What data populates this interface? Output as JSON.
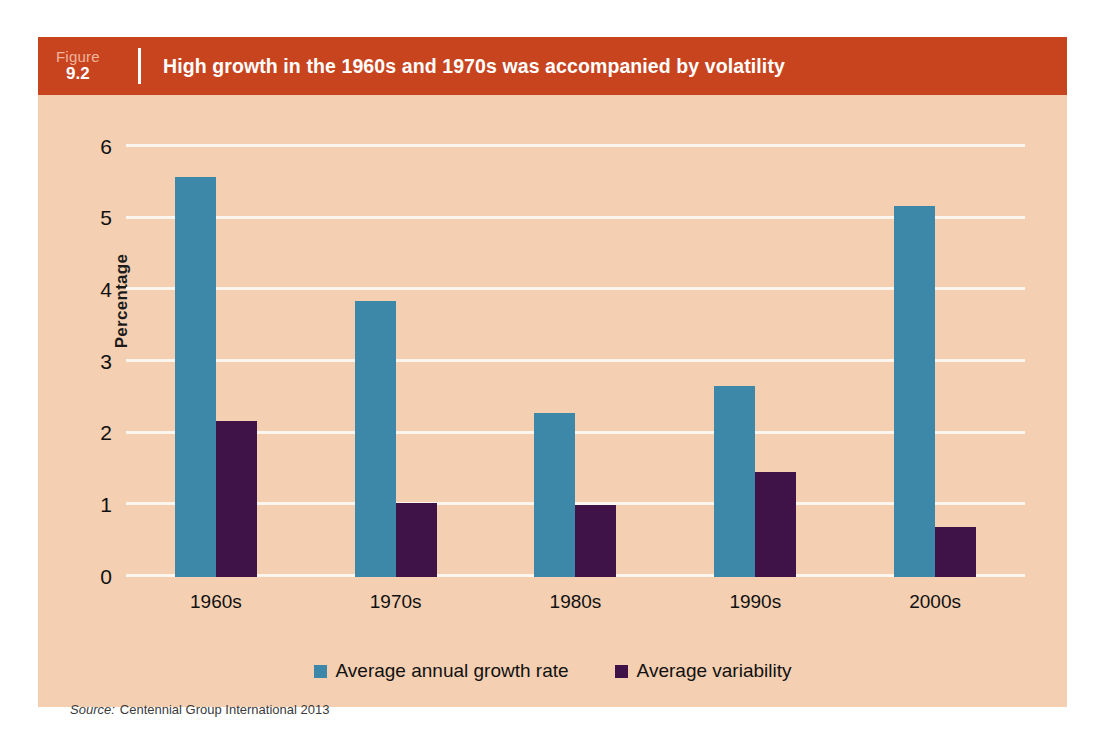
{
  "figure": {
    "label_word": "Figure",
    "number": "9.2",
    "title": "High growth in the 1960s and 1970s was accompanied by volatility",
    "source_word": "Source:",
    "source_text": "Centennial Group International 2013"
  },
  "colors": {
    "header_red": "#c8441f",
    "panel_background": "#f4cfb1",
    "gridline": "#fdf6ee",
    "series_growth": "#3d87a8",
    "series_variability": "#3f1347"
  },
  "chart_data": {
    "type": "bar",
    "title": "High growth in the 1960s and 1970s was accompanied by volatility",
    "xlabel": "",
    "ylabel": "Percentage",
    "ylim": [
      0,
      6
    ],
    "yticks": [
      0,
      1,
      2,
      3,
      4,
      5,
      6
    ],
    "ytick_labels": [
      "0",
      "1",
      "2",
      "3",
      "4",
      "5",
      "6"
    ],
    "grid": true,
    "legend_position": "bottom",
    "categories": [
      "1960s",
      "1970s",
      "1980s",
      "1990s",
      "2000s"
    ],
    "series": [
      {
        "name": "Average annual growth rate",
        "color": "#3d87a8",
        "values": [
          5.58,
          3.85,
          2.29,
          2.66,
          5.18
        ]
      },
      {
        "name": "Average variability",
        "color": "#3f1347",
        "values": [
          2.17,
          1.03,
          1.0,
          1.47,
          0.7
        ]
      }
    ]
  }
}
